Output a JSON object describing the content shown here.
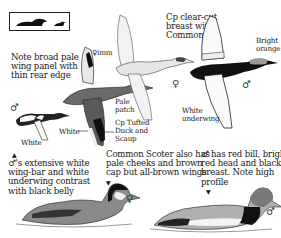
{
  "silhouette_box": {
    "icon": "swimming-duck-silhouettes"
  },
  "labels": {
    "wing_panel_note": "Note broad pale\nwing panel with\nthin rear edge",
    "female_imm": "♀imm",
    "cp_clear_cut": "Cp clear-cut\nbreast with\nCommon sp",
    "bright_orange": "Bright\norange",
    "pale_patch": "Pale\npatch",
    "white_underwing": "White\nunderwing",
    "cp_tufted": "Cp Tufted\nDuck and\nScaup",
    "white_1": "White",
    "white_2": "White",
    "male_wingbar_note": "♂'s extensive white\nwing-bar and white\nunderwing contrast\nwith black belly",
    "common_scoter_note": "Common Scoter also has\npale cheeks and brown\ncap but all-brown wings",
    "male_red_bill_note": "♂ has red bill, bright\nred head and black\nbreast. Note high\nprofile"
  },
  "symbols": {
    "male": "♂",
    "female": "♀",
    "pointer": "▲",
    "pointer_down": "▼"
  },
  "colors": {
    "ink": "#1a1a1a",
    "black_plumage": "#111111",
    "dark_grey": "#555555",
    "mid_grey": "#8a8a8a",
    "light_grey": "#c8c8c8",
    "paper": "#ffffff"
  }
}
